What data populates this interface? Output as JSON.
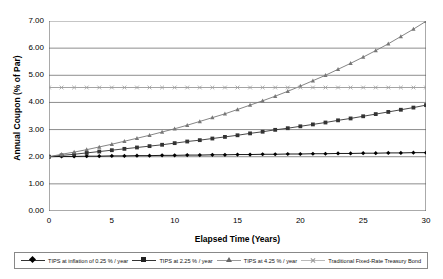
{
  "chart_data": {
    "type": "line",
    "title": "",
    "xlabel": "Elapsed Time (Years)",
    "ylabel": "Annual Coupon (% of Par)",
    "xlim": [
      0,
      30
    ],
    "ylim": [
      0,
      7
    ],
    "xticks": [
      "0",
      "5",
      "10",
      "15",
      "20",
      "25",
      "30"
    ],
    "yticks": [
      "0.00",
      "1.00",
      "2.00",
      "3.00",
      "4.00",
      "5.00",
      "6.00",
      "7.00"
    ],
    "grid": "horizontal",
    "legend_position": "bottom",
    "x": [
      0,
      1,
      2,
      3,
      4,
      5,
      6,
      7,
      8,
      9,
      10,
      11,
      12,
      13,
      14,
      15,
      16,
      17,
      18,
      19,
      20,
      21,
      22,
      23,
      24,
      25,
      26,
      27,
      28,
      29,
      30
    ],
    "series": [
      {
        "name": "TIPS at inflation of 0.25 % / year",
        "marker": "diamond",
        "color": "#000000",
        "values": [
          2.0,
          2.01,
          2.01,
          2.02,
          2.02,
          2.03,
          2.03,
          2.04,
          2.04,
          2.05,
          2.05,
          2.06,
          2.06,
          2.07,
          2.07,
          2.08,
          2.08,
          2.09,
          2.09,
          2.1,
          2.1,
          2.11,
          2.11,
          2.12,
          2.12,
          2.13,
          2.13,
          2.14,
          2.14,
          2.15,
          2.15
        ]
      },
      {
        "name": "TIPS at 2.25 % / year",
        "marker": "square",
        "color": "#333333",
        "values": [
          2.0,
          2.05,
          2.09,
          2.14,
          2.19,
          2.24,
          2.29,
          2.34,
          2.39,
          2.44,
          2.5,
          2.56,
          2.61,
          2.67,
          2.73,
          2.79,
          2.86,
          2.92,
          2.99,
          3.05,
          3.12,
          3.19,
          3.26,
          3.34,
          3.41,
          3.49,
          3.57,
          3.65,
          3.73,
          3.81,
          3.9
        ]
      },
      {
        "name": "TIPS at 4.25 % / year",
        "marker": "triangle",
        "color": "#777777",
        "values": [
          2.0,
          2.09,
          2.17,
          2.26,
          2.36,
          2.46,
          2.57,
          2.68,
          2.79,
          2.91,
          3.03,
          3.16,
          3.3,
          3.44,
          3.58,
          3.74,
          3.9,
          4.06,
          4.23,
          4.41,
          4.6,
          4.8,
          5.0,
          5.22,
          5.44,
          5.67,
          5.91,
          6.16,
          6.43,
          6.7,
          6.99
        ]
      },
      {
        "name": "Traditional Fixed-Rate Treasury Bond",
        "marker": "x",
        "color": "#9a9a9a",
        "values": [
          4.55,
          4.55,
          4.55,
          4.55,
          4.55,
          4.55,
          4.55,
          4.55,
          4.55,
          4.55,
          4.55,
          4.55,
          4.55,
          4.55,
          4.55,
          4.55,
          4.55,
          4.55,
          4.55,
          4.55,
          4.55,
          4.55,
          4.55,
          4.55,
          4.55,
          4.55,
          4.55,
          4.55,
          4.55,
          4.55,
          4.55
        ]
      }
    ]
  },
  "legend": {
    "items": [
      {
        "label": "TIPS at inflation of 0.25 % / year",
        "marker": "diamond-marker"
      },
      {
        "label": "TIPS at 2.25 % / year",
        "marker": "square-marker"
      },
      {
        "label": "TIPS at 4.25 % / year",
        "marker": "triangle-marker"
      },
      {
        "label": "Traditional Fixed-Rate Treasury Bond",
        "marker": "x-marker"
      }
    ]
  }
}
